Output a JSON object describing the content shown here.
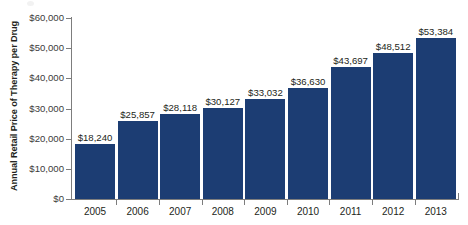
{
  "chart_data": {
    "type": "bar",
    "title": "",
    "xlabel": "",
    "ylabel": "Annual Retail Price of Therapy per Drug",
    "categories": [
      "2005",
      "2006",
      "2007",
      "2008",
      "2009",
      "2010",
      "2011",
      "2012",
      "2013"
    ],
    "values": [
      18240,
      25857,
      28118,
      30127,
      33032,
      36630,
      43697,
      48512,
      53384
    ],
    "value_labels": [
      "$18,240",
      "$25,857",
      "$28,118",
      "$30,127",
      "$33,032",
      "$36,630",
      "$43,697",
      "$48,512",
      "$53,384"
    ],
    "ylim": [
      0,
      60000
    ],
    "y_ticks": [
      0,
      10000,
      20000,
      30000,
      40000,
      50000,
      60000
    ],
    "y_tick_labels": [
      "$0",
      "$10,000",
      "$20,000",
      "$30,000",
      "$40,000",
      "$50,000",
      "$60,000"
    ],
    "grid": false,
    "legend": false,
    "series": [
      {
        "name": "Annual Retail Price of Therapy per Drug",
        "values": [
          18240,
          25857,
          28118,
          30127,
          33032,
          36630,
          43697,
          48512,
          53384
        ],
        "color": "#1c3d73"
      }
    ],
    "colors": {
      "bar": "#1c3d73",
      "axis": "#7d7d7d",
      "text": "#231f20",
      "tick_text": "#3b3b3b",
      "background": "#ffffff"
    }
  },
  "axis": {
    "y_title": "Annual Retail Price of Therapy per Drug"
  }
}
